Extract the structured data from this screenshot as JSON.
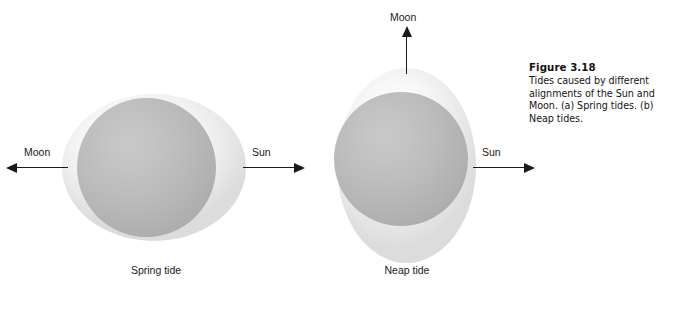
{
  "figure": {
    "caption_title": "Figure 3.18",
    "caption_body": "Tides caused by different alignments of the Sun and Moon. (a) Spring tides. (b) Neap tides."
  },
  "diagrams": [
    {
      "id": "spring",
      "tide_label": "Spring tide",
      "moon_label": "Moon",
      "sun_label": "Sun",
      "moon_direction": "left",
      "sun_direction": "right",
      "bulge_orientation": "horizontal",
      "bulge_color": "#eeeeee",
      "earth_color": "#b6b6b6"
    },
    {
      "id": "neap",
      "tide_label": "Neap tide",
      "moon_label": "Moon",
      "sun_label": "Sun",
      "moon_direction": "up",
      "sun_direction": "right",
      "bulge_orientation": "vertical",
      "bulge_color": "#eeeeee",
      "earth_color": "#b6b6b6"
    }
  ]
}
